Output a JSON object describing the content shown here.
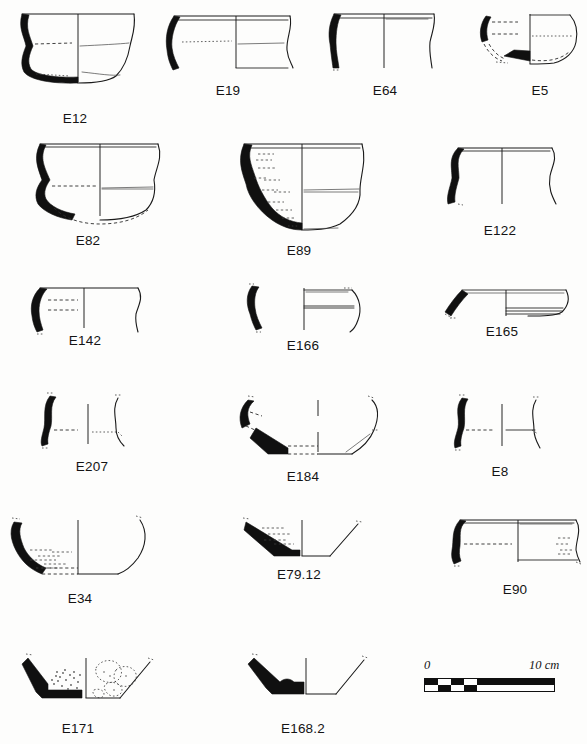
{
  "plate": {
    "type": "archaeological-pottery-profile-plate",
    "background_color": "#fdfdfc",
    "ink_color": "#101010",
    "width": 587,
    "height": 744,
    "rows": 6,
    "figure_count": 17
  },
  "figures": [
    {
      "id": "E12",
      "label": "E12",
      "row": 1,
      "col": 1,
      "caption_x": 75,
      "caption_y": 112,
      "form": "closed bowl / jar, everted rim, rounded base",
      "profile_half": "left-solid-black"
    },
    {
      "id": "E19",
      "label": "E19",
      "row": 1,
      "col": 2,
      "caption_x": 228,
      "caption_y": 84,
      "form": "open bowl, flaring wall rim sherd",
      "profile_half": "left-solid-black"
    },
    {
      "id": "E64",
      "label": "E64",
      "row": 1,
      "col": 3,
      "caption_x": 385,
      "caption_y": 84,
      "form": "straight-walled bowl rim sherd",
      "profile_half": "left-solid-black"
    },
    {
      "id": "E5",
      "label": "E5",
      "row": 1,
      "col": 4,
      "caption_x": 540,
      "caption_y": 84,
      "form": "carinated bowl, restored base",
      "profile_half": "left-solid-black"
    },
    {
      "id": "E82",
      "label": "E82",
      "row": 2,
      "col": 1,
      "caption_x": 88,
      "caption_y": 234,
      "form": "s-profile bowl with restored rounded base",
      "profile_half": "left-solid-black"
    },
    {
      "id": "E89",
      "label": "E89",
      "row": 2,
      "col": 2,
      "caption_x": 299,
      "caption_y": 244,
      "form": "deep bowl, flat base, burnished body",
      "profile_half": "left-solid-black"
    },
    {
      "id": "E122",
      "label": "E122",
      "row": 2,
      "col": 3,
      "caption_x": 500,
      "caption_y": 224,
      "form": "wide s-profile bowl rim",
      "profile_half": "left-solid-black"
    },
    {
      "id": "E142",
      "label": "E142",
      "row": 3,
      "col": 1,
      "caption_x": 85,
      "caption_y": 334,
      "form": "shallow open bowl rim",
      "profile_half": "left-solid-black"
    },
    {
      "id": "E166",
      "label": "E166",
      "row": 3,
      "col": 2,
      "caption_x": 303,
      "caption_y": 339,
      "form": "small rim sherd and body profile",
      "profile_half": "left-solid-black"
    },
    {
      "id": "E165",
      "label": "E165",
      "row": 3,
      "col": 3,
      "caption_x": 502,
      "caption_y": 325,
      "form": "flaring plate / platter rim",
      "profile_half": "left-solid-black"
    },
    {
      "id": "E207",
      "label": "E207",
      "row": 4,
      "col": 1,
      "caption_x": 92,
      "caption_y": 460,
      "form": "narrow s-profile rim sherd",
      "profile_half": "left-solid-black"
    },
    {
      "id": "E184",
      "label": "E184",
      "row": 4,
      "col": 2,
      "caption_x": 303,
      "caption_y": 470,
      "form": "bowl with thickened lower wall and flat base",
      "profile_half": "left-solid-black"
    },
    {
      "id": "E8",
      "label": "E8",
      "row": 4,
      "col": 3,
      "caption_x": 500,
      "caption_y": 465,
      "form": "small s-profile rim sherd",
      "profile_half": "left-solid-black"
    },
    {
      "id": "E34",
      "label": "E34",
      "row": 5,
      "col": 1,
      "caption_x": 80,
      "caption_y": 592,
      "form": "bowl with flat base, coarse fabric",
      "profile_half": "left-solid-black"
    },
    {
      "id": "E79.12",
      "label": "E79.12",
      "row": 5,
      "col": 2,
      "caption_x": 299,
      "caption_y": 568,
      "form": "conical base sherd, thick fabric",
      "profile_half": "left-solid-black"
    },
    {
      "id": "E90",
      "label": "E90",
      "row": 5,
      "col": 3,
      "caption_x": 515,
      "caption_y": 583,
      "form": "wide open bowl rim",
      "profile_half": "left-solid-black"
    },
    {
      "id": "E171",
      "label": "E171",
      "row": 6,
      "col": 1,
      "caption_x": 78,
      "caption_y": 722,
      "form": "base sherd with coarse inclusions / stipple fabric",
      "profile_half": "left-solid-black"
    },
    {
      "id": "E168.2",
      "label": "E168.2",
      "row": 6,
      "col": 2,
      "caption_x": 303,
      "caption_y": 722,
      "form": "thick base sherd, low ring foot",
      "profile_half": "left-solid-black"
    }
  ],
  "scale": {
    "zero_label": "0",
    "max_label": "10 cm",
    "unit": "cm",
    "length_cm": 10,
    "segments": 10,
    "bar_x": 424,
    "bar_y": 678,
    "bar_width": 130,
    "bar_height": 13,
    "checker_segments": 5,
    "zero_label_x": 424,
    "zero_label_y": 660,
    "max_label_x": 530,
    "max_label_y": 660
  }
}
